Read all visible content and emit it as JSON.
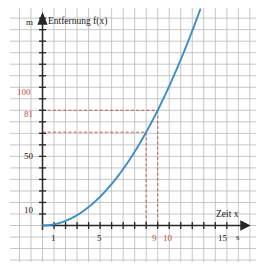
{
  "chart_data": {
    "type": "line",
    "title": "Entfernung f(x)",
    "xlabel": "Zeit x",
    "ylabel": "Entfernung f(x)",
    "x_unit": "s",
    "y_unit": "m",
    "xlim": [
      0,
      16
    ],
    "ylim": [
      0,
      200
    ],
    "grid": true,
    "legend": "none",
    "function": "f(x) = x^2",
    "x_ticks": [
      1,
      2,
      3,
      4,
      5,
      6,
      7,
      8,
      9,
      10,
      11,
      12,
      13,
      14,
      15,
      16
    ],
    "x_tick_labels": [
      {
        "value": 1,
        "text": "1",
        "color": "#1a1a1a"
      },
      {
        "value": 5,
        "text": "5",
        "color": "#1a1a1a"
      },
      {
        "value": 9,
        "text": "9",
        "color": "#c0503a"
      },
      {
        "value": 10,
        "text": "10",
        "color": "#c0503a"
      },
      {
        "value": 15,
        "text": "15",
        "color": "#1a1a1a"
      }
    ],
    "y_ticks": [
      10,
      20,
      30,
      40,
      50,
      60,
      70,
      80,
      90,
      100,
      110,
      120,
      130,
      140,
      150,
      160,
      170,
      180,
      190
    ],
    "y_tick_labels": [
      {
        "value": 10,
        "text": "10",
        "color": "#1a1a1a"
      },
      {
        "value": 50,
        "text": "50",
        "color": "#1a1a1a"
      },
      {
        "value": 81,
        "text": "81",
        "color": "#c0503a"
      },
      {
        "value": 100,
        "text": "100",
        "color": "#c0503a"
      }
    ],
    "series": [
      {
        "name": "f(x) = x^2",
        "color": "#3d8ec4",
        "x": [
          0,
          0.5,
          1,
          1.5,
          2,
          2.5,
          3,
          3.5,
          4,
          4.5,
          5,
          5.5,
          6,
          6.5,
          7,
          7.5,
          8,
          8.5,
          9,
          9.5,
          10,
          10.5,
          11,
          11.5,
          12,
          12.5,
          13,
          13.5,
          14
        ],
        "values": [
          0,
          0.25,
          1,
          2.25,
          4,
          6.25,
          9,
          12.25,
          16,
          20.25,
          25,
          30.25,
          36,
          42.25,
          49,
          56.25,
          64,
          72.25,
          81,
          90.25,
          100,
          110.25,
          121,
          132.25,
          144,
          156.25,
          169,
          182.25,
          196
        ]
      }
    ],
    "annotations": [
      {
        "name": "guide-81-at-9",
        "x": 9,
        "y": 81,
        "color": "#c0503a",
        "style": "dashed",
        "label_x": "9",
        "label_y": "81"
      },
      {
        "name": "guide-100-at-10",
        "x": 10,
        "y": 100,
        "color": "#c0503a",
        "style": "dashed",
        "label_x": "10",
        "label_y": "100"
      }
    ]
  },
  "labels": {
    "y_unit": "m",
    "x_unit": "s",
    "title": "Entfernung f(x)",
    "x_axis_title": "Zeit x",
    "tick_x_1": "1",
    "tick_x_5": "5",
    "tick_x_9": "9",
    "tick_x_10": "10",
    "tick_x_15": "15",
    "tick_y_10": "10",
    "tick_y_50": "50",
    "tick_y_81": "81",
    "tick_y_100": "100"
  },
  "colors": {
    "curve": "#3d8ec4",
    "highlight": "#c0503a",
    "axis": "#262626",
    "grid_major": "#b7b7b7",
    "grid_minor": "#dddddd",
    "background": "#ffffff"
  }
}
